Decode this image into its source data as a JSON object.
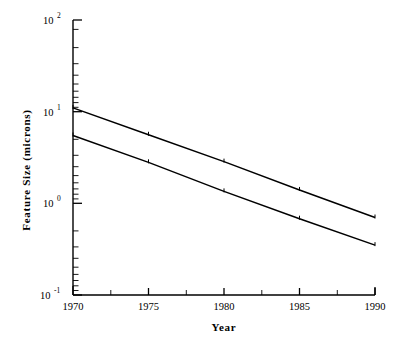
{
  "chart_data": {
    "type": "line",
    "title": "",
    "xlabel": "Year",
    "ylabel": "Feature  Size  (microns)",
    "xlim": [
      1970,
      1990
    ],
    "ylim": [
      0.1,
      100
    ],
    "yscale": "log",
    "xscale": "linear",
    "grid": false,
    "legend": "none",
    "x": [
      1970,
      1975,
      1980,
      1985,
      1990
    ],
    "xtick_labels": [
      "1970",
      "1975",
      "1980",
      "1985",
      "1990"
    ],
    "ytick_labels": [
      "10-1",
      "100",
      "101",
      "102"
    ],
    "ytick_mantissa": [
      "10",
      "10",
      "10",
      "10"
    ],
    "ytick_exponents": [
      "-1",
      "0",
      "1",
      "2"
    ],
    "ytick_values": [
      0.1,
      1,
      10,
      100
    ],
    "series": [
      {
        "name": "upper",
        "values": [
          11.0,
          5.6,
          2.85,
          1.4,
          0.7
        ]
      },
      {
        "name": "lower",
        "values": [
          5.5,
          2.8,
          1.35,
          0.68,
          0.35
        ]
      }
    ],
    "markers": "tick",
    "annotations": []
  },
  "figure": {
    "background_color": "#ffffff",
    "line_color": "#000000"
  }
}
